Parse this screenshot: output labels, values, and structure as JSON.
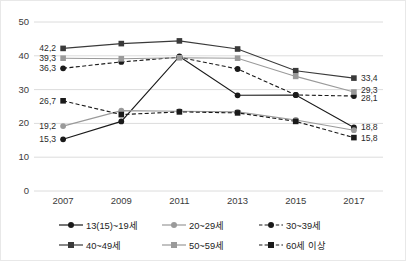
{
  "chart_data": {
    "type": "line",
    "title": "",
    "xlabel": "",
    "ylabel": "",
    "categories": [
      "2007",
      "2009",
      "2011",
      "2013",
      "2015",
      "2017"
    ],
    "ylim": [
      0,
      50
    ],
    "yticks": [
      "0",
      "10",
      "20",
      "30",
      "40",
      "50"
    ],
    "grid": true,
    "legend_position": "bottom",
    "decimal_separator": ",",
    "series": [
      {
        "name": "13(15)~19세",
        "marker": "circle",
        "line_style": "solid",
        "color": "#1a1a1a",
        "values": [
          15.3,
          20.6,
          39.8,
          28.3,
          28.4,
          18.8
        ],
        "labels": {
          "first": "15,3",
          "last": "18,8"
        }
      },
      {
        "name": "20~29세",
        "marker": "circle",
        "line_style": "solid",
        "color": "#9a9a9a",
        "values": [
          19.2,
          23.8,
          23.6,
          23.4,
          21.0,
          18.0
        ],
        "labels": {
          "first": "19,2",
          "last": ""
        }
      },
      {
        "name": "30~39세",
        "marker": "circle",
        "line_style": "dashed",
        "color": "#1a1a1a",
        "values": [
          36.3,
          38.2,
          39.6,
          36.1,
          28.4,
          28.1
        ],
        "labels": {
          "first": "36,3",
          "last": "28,1"
        }
      },
      {
        "name": "40~49세",
        "marker": "square",
        "line_style": "solid",
        "color": "#3a3a3a",
        "values": [
          42.2,
          43.6,
          44.4,
          42.0,
          35.6,
          33.4
        ],
        "labels": {
          "first": "42,2",
          "last": "33,4"
        }
      },
      {
        "name": "50~59세",
        "marker": "square",
        "line_style": "solid",
        "color": "#9a9a9a",
        "values": [
          39.3,
          39.1,
          39.4,
          39.3,
          33.9,
          29.3
        ],
        "labels": {
          "first": "39,3",
          "last": "29,3"
        }
      },
      {
        "name": "60세 이상",
        "marker": "square",
        "line_style": "dashed",
        "color": "#1a1a1a",
        "values": [
          26.7,
          22.6,
          23.4,
          23.1,
          20.6,
          15.8
        ],
        "labels": {
          "first": "26,7",
          "last": "15,8"
        }
      }
    ]
  }
}
